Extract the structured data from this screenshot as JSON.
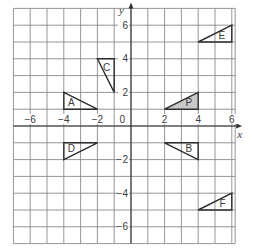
{
  "grid": {
    "x_min": -7,
    "x_max": 6.2,
    "y_min": -7,
    "y_max": 7,
    "origin_px": [
      131,
      126
    ],
    "cell_px": 16.8
  },
  "axes": {
    "x_label": "x",
    "y_label": "y",
    "origin_label": "0",
    "x_ticks": [
      {
        "value": -6,
        "label": "−6"
      },
      {
        "value": -4,
        "label": "−4"
      },
      {
        "value": -2,
        "label": "−2"
      },
      {
        "value": 2,
        "label": "2"
      },
      {
        "value": 4,
        "label": "4"
      },
      {
        "value": 6,
        "label": "6"
      }
    ],
    "y_ticks": [
      {
        "value": 6,
        "label": "6"
      },
      {
        "value": 4,
        "label": "4"
      },
      {
        "value": 2,
        "label": "2"
      },
      {
        "value": -2,
        "label": "−2"
      },
      {
        "value": -4,
        "label": "−4"
      },
      {
        "value": -6,
        "label": "−6"
      }
    ]
  },
  "shapes": [
    {
      "label": "A",
      "vertices": [
        [
          -4,
          2
        ],
        [
          -4,
          1
        ],
        [
          -2,
          1
        ]
      ],
      "label_at": [
        -3.55,
        1.2
      ],
      "shaded": false
    },
    {
      "label": "C",
      "vertices": [
        [
          -2,
          4
        ],
        [
          -1,
          4
        ],
        [
          -1,
          2
        ]
      ],
      "label_at": [
        -1.45,
        3.3
      ],
      "shaded": false
    },
    {
      "label": "E",
      "vertices": [
        [
          4,
          5
        ],
        [
          6,
          5
        ],
        [
          6,
          6
        ]
      ],
      "label_at": [
        5.4,
        5.2
      ],
      "shaded": false
    },
    {
      "label": "P",
      "vertices": [
        [
          2,
          1
        ],
        [
          4,
          1
        ],
        [
          4,
          2
        ]
      ],
      "label_at": [
        3.45,
        1.2
      ],
      "shaded": true
    },
    {
      "label": "D",
      "vertices": [
        [
          -4,
          -1
        ],
        [
          -2,
          -1
        ],
        [
          -4,
          -2
        ]
      ],
      "label_at": [
        -3.55,
        -1.55
      ],
      "shaded": false
    },
    {
      "label": "B",
      "vertices": [
        [
          2,
          -1
        ],
        [
          4,
          -1
        ],
        [
          4,
          -2
        ]
      ],
      "label_at": [
        3.45,
        -1.55
      ],
      "shaded": false
    },
    {
      "label": "F",
      "vertices": [
        [
          4,
          -5
        ],
        [
          6,
          -5
        ],
        [
          6,
          -4
        ]
      ],
      "label_at": [
        5.45,
        -4.8
      ],
      "shaded": false
    }
  ],
  "colors": {
    "grid": "#8a8a8a",
    "axis": "#333333",
    "outline": "#2e2e2e",
    "shaded_fill": "#c9c9c9",
    "text": "#3a3a3a"
  }
}
